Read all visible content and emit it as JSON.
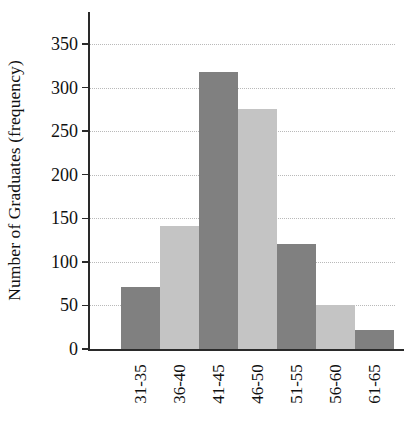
{
  "chart_data": {
    "type": "bar",
    "title": "",
    "subtitle": "",
    "xlabel": "",
    "ylabel": "Number of Graduates (frequency)",
    "categories": [
      "31-35",
      "36-40",
      "41-45",
      "46-50",
      "51-55",
      "56-60",
      "61-65"
    ],
    "values": [
      71,
      141,
      318,
      275,
      121,
      50,
      22
    ],
    "series": [
      {
        "name": "Number of Graduates",
        "values": [
          71,
          141,
          318,
          275,
          121,
          50,
          22
        ]
      }
    ],
    "bar_colors": [
      "#808080",
      "#c4c4c4",
      "#808080",
      "#c4c4c4",
      "#808080",
      "#c4c4c4",
      "#808080"
    ],
    "ylim": [
      0,
      350
    ],
    "ytick_values": [
      0,
      50,
      100,
      150,
      200,
      250,
      300,
      350
    ],
    "ytick_labels": [
      "0",
      "50",
      "100",
      "150",
      "200",
      "250",
      "300",
      "350"
    ],
    "grid": true,
    "gridline_style": "dotted",
    "gridline_color": "#b9b9b9",
    "legend": false,
    "legend_position": "none",
    "axis_color": "#2a2a2a",
    "background_color": "#ffffff",
    "bar_gap": 0,
    "xtick_label_rotation": -90
  }
}
